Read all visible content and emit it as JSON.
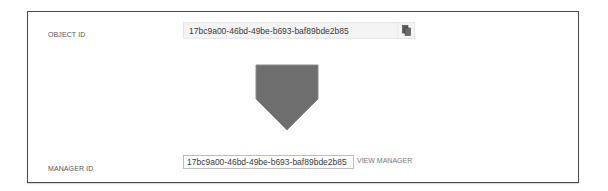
{
  "object_id": {
    "label": "OBJECT ID",
    "value": "17bc9a00-46bd-49be-b693-baf89bde2b85",
    "copy_icon": "copy-icon"
  },
  "shape": {
    "type": "pentagon-arrow-down",
    "fill": "#6e6e6e",
    "stroke": "#8a8a8a"
  },
  "manager_id": {
    "label": "MANAGER ID",
    "value": "17bc9a00-46bd-49be-b693-baf89bde2b85",
    "link_label": "VIEW MANAGER"
  },
  "colors": {
    "frame_border": "#4a4a4a",
    "label_text": "#555555",
    "field_bg": "#f4f4f4",
    "link_text": "#777777"
  }
}
